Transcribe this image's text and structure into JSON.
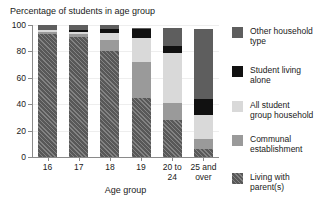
{
  "chart_data": {
    "type": "bar",
    "stacked": true,
    "title": "Percentage of students in age group",
    "xlabel": "Age group",
    "ylabel": "",
    "ylim": [
      0,
      100
    ],
    "yticks": [
      0,
      20,
      40,
      60,
      80,
      100
    ],
    "ytick_labels": [
      "0",
      "20",
      "40",
      "60",
      "80",
      "100"
    ],
    "grid": true,
    "legend_position": "right",
    "categories": [
      "16",
      "17",
      "18",
      "19",
      "20 to 24",
      "25 and over"
    ],
    "category_labels": [
      [
        "16"
      ],
      [
        "17"
      ],
      [
        "18"
      ],
      [
        "19"
      ],
      [
        "20 to",
        "24"
      ],
      [
        "25 and",
        "over"
      ]
    ],
    "series": [
      {
        "name": "Living with parent(s)",
        "color": "#585858",
        "hatch": "diagonal",
        "values": [
          93,
          91,
          80,
          45,
          28,
          6
        ]
      },
      {
        "name": "Communal establishment",
        "color": "#9a9a9a",
        "values": [
          2,
          2,
          9,
          27,
          13,
          8
        ]
      },
      {
        "name": "All student group household",
        "color": "#d9d9d9",
        "values": [
          1,
          2,
          5,
          18,
          38,
          18
        ]
      },
      {
        "name": "Student living alone",
        "color": "#111111",
        "values": [
          0,
          1,
          3,
          7,
          5,
          12
        ]
      },
      {
        "name": "Other household type",
        "color": "#5e5e5e",
        "values": [
          4,
          4,
          3,
          1,
          14,
          53
        ]
      }
    ],
    "legend_entries": [
      {
        "label_lines": [
          "Other household",
          "type"
        ],
        "color": "#5e5e5e"
      },
      {
        "label_lines": [
          "Student living",
          "alone"
        ],
        "color": "#111111"
      },
      {
        "label_lines": [
          "All student",
          "group household"
        ],
        "color": "#d9d9d9"
      },
      {
        "label_lines": [
          "Communal",
          "establishment"
        ],
        "color": "#9a9a9a"
      },
      {
        "label_lines": [
          "Living with",
          "parent(s)"
        ],
        "color": "#585858"
      }
    ]
  },
  "legend": {
    "items": [
      {
        "line1": "Other household",
        "line2": "type"
      },
      {
        "line1": "Student living",
        "line2": "alone"
      },
      {
        "line1": "All student",
        "line2": "group household"
      },
      {
        "line1": "Communal",
        "line2": "establishment"
      },
      {
        "line1": "Living with",
        "line2": "parent(s)"
      }
    ]
  },
  "axes": {
    "y_labels": [
      "100",
      "80",
      "60",
      "40",
      "20",
      "0"
    ],
    "x_title": "Age group"
  }
}
